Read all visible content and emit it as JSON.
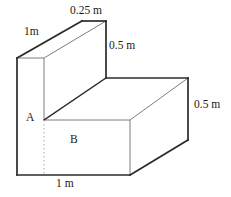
{
  "figure": {
    "shape_type": "composite-rectangular-prism",
    "stroke_color": "#2b2b2b",
    "thin_stroke_color": "#6e6e6e",
    "dashed_color": "#b0b0b0",
    "fill_color": "#ffffff",
    "labels": {
      "top_depth": "0.25 m",
      "top_slant": "1m",
      "upper_height": "0.5 m",
      "lower_height": "0.5 m",
      "point_a": "A",
      "face_b": "B",
      "bottom_width": "1 m"
    },
    "dimensions": [
      {
        "name": "top-depth",
        "value": "0.25 m",
        "edge": "top-back-horizontal"
      },
      {
        "name": "top-slant",
        "value": "1m",
        "edge": "upper-left-receding"
      },
      {
        "name": "upper-height",
        "value": "0.5 m",
        "edge": "upper-block-right-vertical"
      },
      {
        "name": "lower-height",
        "value": "0.5 m",
        "edge": "lower-block-right-vertical"
      },
      {
        "name": "bottom-width",
        "value": "1 m",
        "edge": "bottom-front-horizontal"
      }
    ],
    "annotations": [
      {
        "name": "point-a",
        "text": "A",
        "meaning": "vertex label on front left face"
      },
      {
        "name": "face-b",
        "text": "B",
        "meaning": "front face label of lower block"
      }
    ]
  }
}
